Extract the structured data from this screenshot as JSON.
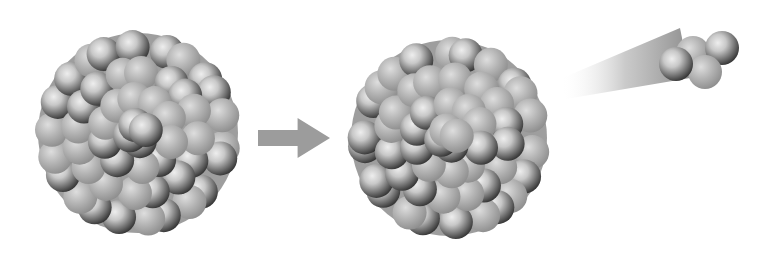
{
  "diagram": {
    "kind": "alpha-decay-illustration",
    "colors": {
      "background": "#ffffff",
      "proton_light": "#e4e4e4",
      "proton_mid": "#9a9a9a",
      "proton_dark": "#3a3a3a",
      "neutron_light": "#d6d6d6",
      "neutron_mid": "#a8a8a8",
      "neutron_dark": "#8a8a8a",
      "arrow": "#9c9c9c",
      "trail": "#b0b0b0"
    },
    "parent_nucleus": {
      "cx": 138,
      "cy": 133,
      "r": 108,
      "ball_r": 17
    },
    "daughter_nucleus": {
      "cx": 449,
      "cy": 138,
      "r": 106,
      "ball_r": 17
    },
    "arrow": {
      "x": 258,
      "y": 118,
      "w": 72,
      "h": 40
    },
    "alpha_particle": {
      "balls": [
        {
          "x": 693,
          "y": 53,
          "type": "n"
        },
        {
          "x": 722,
          "y": 48,
          "type": "p"
        },
        {
          "x": 705,
          "y": 72,
          "type": "n"
        },
        {
          "x": 676,
          "y": 64,
          "type": "p"
        }
      ],
      "ball_r": 17,
      "trail": {
        "x1": 560,
        "y1": 85,
        "x2": 680,
        "y2": 50
      }
    }
  }
}
